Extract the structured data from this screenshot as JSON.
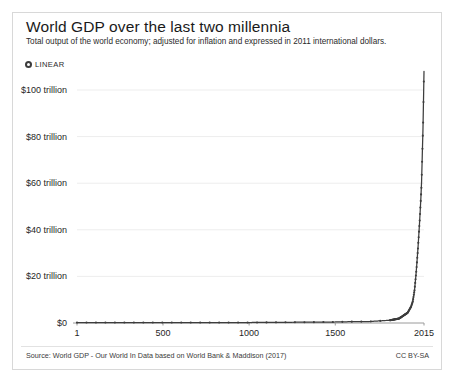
{
  "header": {
    "title": "World GDP over the last two millennia",
    "subtitle": "Total output of the world economy; adjusted for inflation and expressed in 2011 international dollars.",
    "scale_toggle_label": "LINEAR",
    "scale_toggle_icon": "radio-selected-icon"
  },
  "footer": {
    "source": "Source: World GDP - Our World In Data based on World Bank & Maddison (2017)",
    "license": "CC BY-SA"
  },
  "colors": {
    "line": "#3d3d3d",
    "grid": "#ededed",
    "axis": "#9a9a9a",
    "text": "#222222",
    "frame": "#d8d8d8",
    "background": "#ffffff"
  },
  "chart_data": {
    "type": "line",
    "title": "World GDP over the last two millennia",
    "subtitle": "Total output of the world economy; adjusted for inflation and expressed in 2011 international dollars.",
    "xlabel": "",
    "ylabel": "",
    "scale": "linear",
    "grid": true,
    "legend": false,
    "x": [
      1,
      500,
      1000,
      1500,
      1600,
      1700,
      1820,
      1870,
      1900,
      1920,
      1940,
      1950,
      1960,
      1970,
      1980,
      1990,
      2000,
      2010,
      2015
    ],
    "xlim": [
      1,
      2015
    ],
    "ylim": [
      0,
      110
    ],
    "y_unit": "trillion 2011 international dollars",
    "xticks": [
      1,
      500,
      1000,
      1500,
      2015
    ],
    "xtick_labels": [
      "1",
      "500",
      "1000",
      "1500",
      "2015"
    ],
    "yticks": [
      0,
      20,
      40,
      60,
      80,
      100
    ],
    "ytick_labels": [
      "$0",
      "$20 trillion",
      "$40 trillion",
      "$60 trillion",
      "$80 trillion",
      "$100 trillion"
    ],
    "series": [
      {
        "name": "World GDP",
        "values": [
          0.18,
          0.21,
          0.21,
          0.43,
          0.58,
          0.64,
          1.2,
          1.9,
          3.4,
          4.4,
          7.0,
          9.3,
          14.0,
          22.0,
          32.0,
          44.0,
          58.0,
          86.0,
          108.0
        ]
      }
    ],
    "annotations": []
  }
}
